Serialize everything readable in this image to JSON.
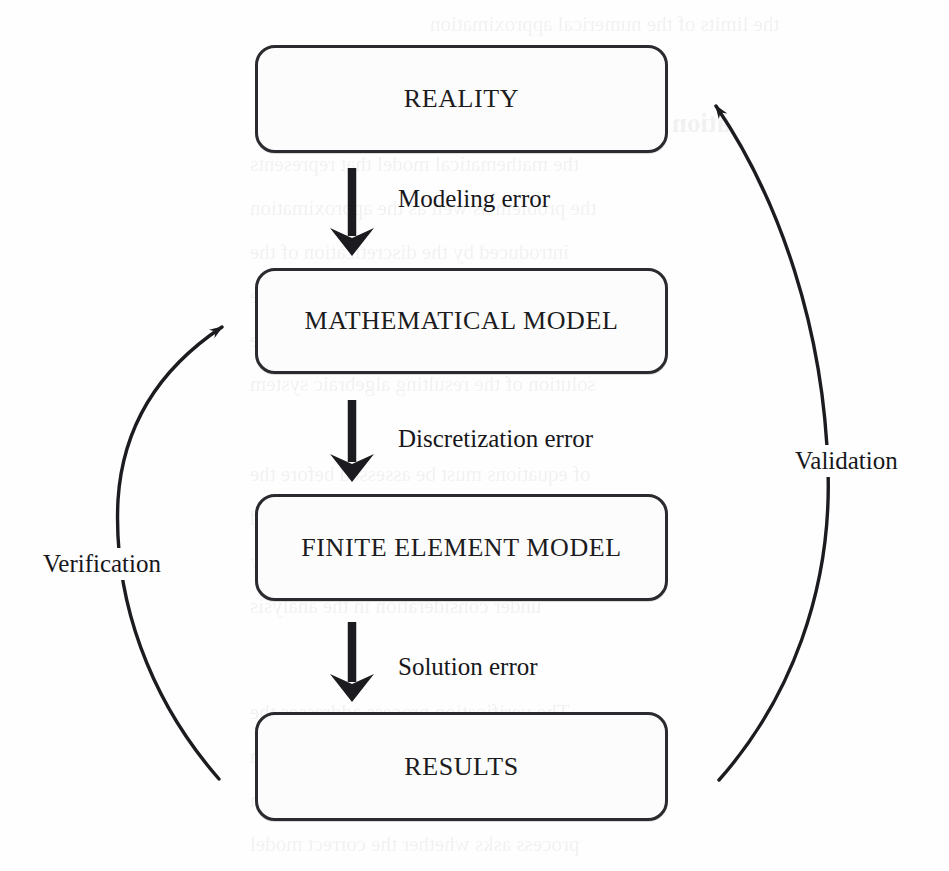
{
  "diagram": {
    "canvas": {
      "width": 949,
      "height": 871
    },
    "background_color": "#fefefe",
    "stroke_color": "#2b2b2f",
    "text_color": "#1c1c20",
    "nodes": [
      {
        "id": "reality",
        "label": "REALITY",
        "x": 255,
        "y": 45,
        "w": 413,
        "h": 108
      },
      {
        "id": "math_model",
        "label": "MATHEMATICAL MODEL",
        "x": 255,
        "y": 268,
        "w": 413,
        "h": 106
      },
      {
        "id": "fe_model",
        "label": "FINITE ELEMENT MODEL",
        "x": 255,
        "y": 494,
        "w": 413,
        "h": 107
      },
      {
        "id": "results",
        "label": "RESULTS",
        "x": 255,
        "y": 712,
        "w": 413,
        "h": 109
      }
    ],
    "straight_arrows": [
      {
        "id": "modeling",
        "label": "Modeling error",
        "label_x": 398,
        "label_y": 185,
        "arrow_x": 352,
        "arrow_y_start": 168,
        "arrow_y_end": 253
      },
      {
        "id": "discretization",
        "label": "Discretization error",
        "label_x": 398,
        "label_y": 425,
        "arrow_x": 352,
        "arrow_y_start": 400,
        "arrow_y_end": 480
      },
      {
        "id": "solution",
        "label": "Solution error",
        "label_x": 398,
        "label_y": 653,
        "arrow_x": 352,
        "arrow_y_start": 622,
        "arrow_y_end": 700
      }
    ],
    "curved_arrows": [
      {
        "id": "verification",
        "label": "Verification",
        "label_x": 38,
        "label_y": 548,
        "from_node": "results",
        "to_node": "math_model",
        "direction": "upward-right"
      },
      {
        "id": "validation",
        "label": "Validation",
        "label_x": 790,
        "label_y": 445,
        "from_node": "results",
        "to_node": "reality",
        "direction": "upward-left"
      }
    ],
    "ghost_text": [
      {
        "text": "the limits of the numerical approximation",
        "x": 430,
        "y": 12,
        "size": 21
      },
      {
        "text": "ation of results",
        "x": 560,
        "y": 108,
        "size": 27,
        "bold": true
      },
      {
        "text": "the mathematical model that represents",
        "x": 250,
        "y": 152,
        "size": 21
      },
      {
        "text": "the problem as well as the approximation",
        "x": 250,
        "y": 196,
        "size": 21
      },
      {
        "text": "introduced by the discretization of the",
        "x": 250,
        "y": 240,
        "size": 21
      },
      {
        "text": "domain into finite elements and by the",
        "x": 250,
        "y": 284,
        "size": 21
      },
      {
        "text": "numerical procedures used to obtain the",
        "x": 250,
        "y": 328,
        "size": 21
      },
      {
        "text": "solution of the resulting algebraic system",
        "x": 250,
        "y": 372,
        "size": 21
      },
      {
        "text": "of equations must be assessed before the",
        "x": 250,
        "y": 462,
        "size": 21
      },
      {
        "text": "results can be accepted as a valid",
        "x": 250,
        "y": 506,
        "size": 21
      },
      {
        "text": "representation of the physical reality",
        "x": 250,
        "y": 550,
        "size": 21
      },
      {
        "text": "under consideration in the analysis",
        "x": 250,
        "y": 594,
        "size": 21
      },
      {
        "text": "The verification process addresses the",
        "x": 250,
        "y": 700,
        "size": 21
      },
      {
        "text": "question whether the model has been",
        "x": 250,
        "y": 744,
        "size": 21
      },
      {
        "text": "solved correctly while the validation",
        "x": 250,
        "y": 788,
        "size": 21
      },
      {
        "text": "process asks whether the correct model",
        "x": 250,
        "y": 832,
        "size": 21
      }
    ]
  }
}
